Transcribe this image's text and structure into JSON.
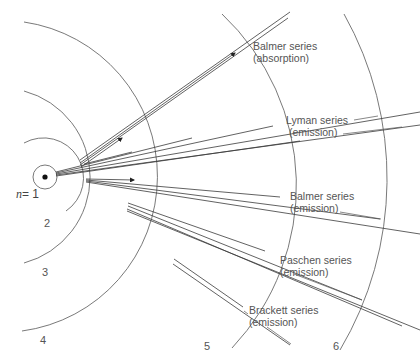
{
  "diagram": {
    "nucleus": {
      "cx": 45,
      "cy": 177
    },
    "orbits": [
      {
        "n": "1",
        "label": "n = 1",
        "r": 12
      },
      {
        "n": "2",
        "label": "2",
        "r": 40
      },
      {
        "n": "3",
        "label": "3",
        "r": 89
      },
      {
        "n": "4",
        "label": "4",
        "r": 156
      },
      {
        "n": "5",
        "label": "5",
        "r": 236
      },
      {
        "n": "6",
        "label": "6",
        "r": 336
      }
    ],
    "orbit_labels": {
      "n1_var": "n",
      "n1_eq": "= 1",
      "n2": "2",
      "n3": "3",
      "n4": "4",
      "n5": "5",
      "n6": "6"
    },
    "series": [
      {
        "id": "balmer-absorption",
        "name": "Balmer series",
        "type": "(absorption)",
        "from_n": 2,
        "to_n": [
          4,
          5
        ]
      },
      {
        "id": "lyman-emission",
        "name": "Lyman series",
        "type": "(emission)",
        "to_n": 1,
        "from_n": [
          2,
          3,
          4,
          5,
          6
        ]
      },
      {
        "id": "balmer-emission",
        "name": "Balmer series",
        "type": "(emission)",
        "to_n": 2,
        "from_n": [
          3,
          4,
          5,
          6
        ]
      },
      {
        "id": "paschen-emission",
        "name": "Paschen series",
        "type": "(emission)",
        "to_n": 3,
        "from_n": [
          4,
          5,
          6
        ]
      },
      {
        "id": "brackett-emission",
        "name": "Brackett series",
        "type": "(emission)",
        "to_n": 4,
        "from_n": [
          5,
          6
        ]
      }
    ],
    "colors": {
      "line": "#3a3a3a",
      "orbit": "#6a6a6a",
      "text": "#555555",
      "background": "#ffffff"
    }
  }
}
